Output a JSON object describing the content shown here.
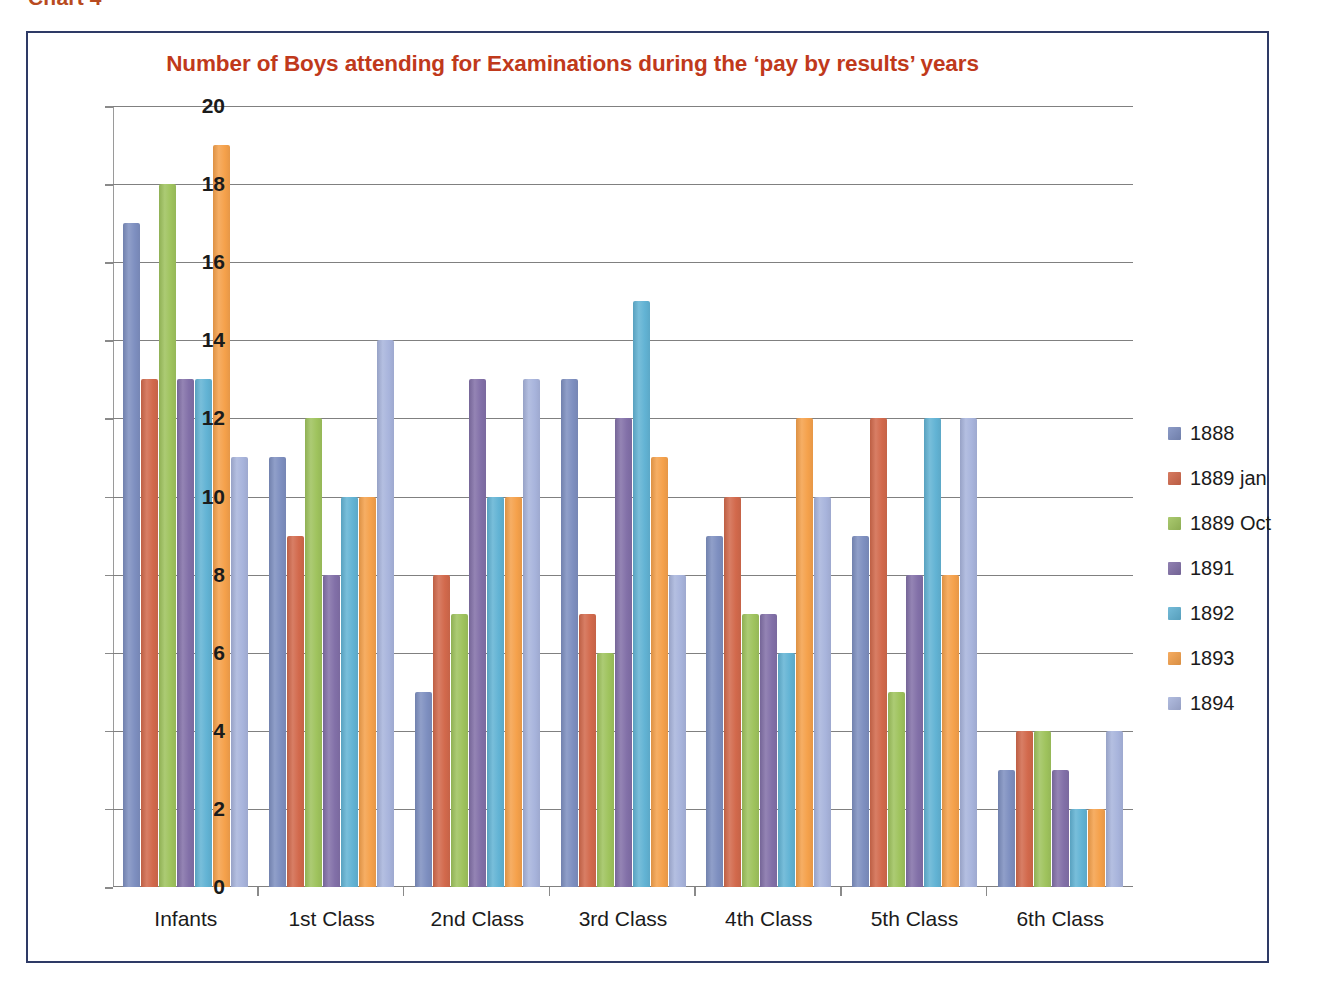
{
  "figure_caption": "Chart 4",
  "frame": {
    "border_color": "#2e3a66"
  },
  "chart_data": {
    "type": "bar",
    "title": "Number of Boys attending for Examinations during the ‘pay by results’ years",
    "xlabel": "",
    "ylabel": "",
    "ylim": [
      0,
      20
    ],
    "ytick_step": 2,
    "ytick_labels": [
      "20",
      "18",
      "16",
      "14",
      "12",
      "10",
      "8",
      "6",
      "4",
      "2",
      "0"
    ],
    "grid": true,
    "legend_position": "right",
    "categories": [
      "Infants",
      "1st Class",
      "2nd Class",
      "3rd Class",
      "4th Class",
      "5th Class",
      "6th Class"
    ],
    "series": [
      {
        "name": "1888",
        "color": "#7e8fc0",
        "values": [
          17,
          11,
          5,
          13,
          9,
          9,
          3
        ]
      },
      {
        "name": "1889 jan",
        "color": "#d2694c",
        "values": [
          13,
          9,
          8,
          7,
          10,
          12,
          4
        ]
      },
      {
        "name": "1889 Oct",
        "color": "#9fc35d",
        "values": [
          18,
          12,
          7,
          6,
          7,
          5,
          4
        ]
      },
      {
        "name": "1891",
        "color": "#8270a8",
        "values": [
          13,
          8,
          13,
          12,
          7,
          8,
          3
        ]
      },
      {
        "name": "1892",
        "color": "#62b3d4",
        "values": [
          13,
          10,
          10,
          15,
          6,
          12,
          2
        ]
      },
      {
        "name": "1893",
        "color": "#f5a14b",
        "values": [
          19,
          10,
          10,
          11,
          12,
          8,
          2
        ]
      },
      {
        "name": "1894",
        "color": "#a8b4dc",
        "values": [
          11,
          14,
          13,
          8,
          10,
          12,
          4
        ]
      }
    ]
  }
}
